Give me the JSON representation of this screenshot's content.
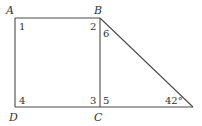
{
  "diagram": {
    "type": "geometry",
    "stroke_color": "#4a4a4a",
    "vertices": {
      "A": {
        "label": "A",
        "x": 15,
        "y": 18
      },
      "B": {
        "label": "B",
        "x": 100,
        "y": 18
      },
      "C": {
        "label": "C",
        "x": 100,
        "y": 107
      },
      "D": {
        "label": "D",
        "x": 15,
        "y": 107
      },
      "E": {
        "label": "",
        "x": 193,
        "y": 107
      }
    },
    "angle_labels": {
      "a1": "1",
      "a2": "2",
      "a3": "3",
      "a4": "4",
      "a5": "5",
      "a6": "6",
      "given": "42°"
    }
  }
}
